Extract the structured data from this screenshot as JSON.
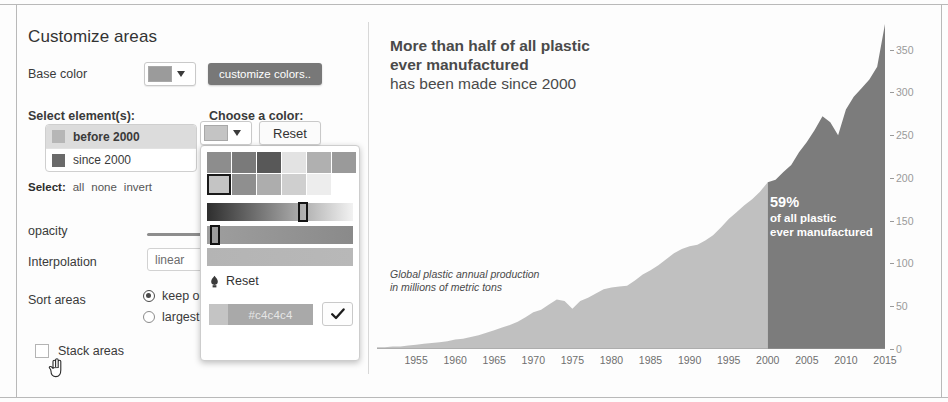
{
  "panel": {
    "title": "Customize areas",
    "base_color_label": "Base color",
    "base_color_value": "#9b9b9b",
    "customize_colors_button": "customize colors..",
    "select_elements_label": "Select element(s):",
    "choose_color_label": "Choose a color:",
    "elements": [
      {
        "label": "before 2000",
        "swatch": "#b6b6b6",
        "selected": true
      },
      {
        "label": "since 2000",
        "swatch": "#6a6a6a",
        "selected": false
      }
    ],
    "select_actions_lead": "Select:",
    "select_actions": [
      "all",
      "none",
      "invert"
    ],
    "opacity_label": "opacity",
    "opacity_value": 100,
    "interpolation_label": "Interpolation",
    "interpolation_value": "linear",
    "sort_label": "Sort areas",
    "sort_options": [
      {
        "label": "keep order",
        "checked": true
      },
      {
        "label": "largest first",
        "checked": false
      }
    ],
    "stack_areas_label": "Stack areas",
    "stack_areas_checked": false,
    "cursor_icon": "hand-pointer-cursor"
  },
  "picker": {
    "current_color": "#c4c4c4",
    "caret_icon": "chevron-down-icon",
    "reset_button": "Reset",
    "reset_row_label": "Reset",
    "reset_row_icon": "reset-brush-icon",
    "hex_value": "#c4c4c4",
    "confirm_icon": "check-icon",
    "swatch_grid": [
      [
        "#8d8d8d",
        "#7a7a7a",
        "#585858",
        "#e3e3e3",
        "#b0b0b0",
        "#9a9a9a"
      ],
      [
        "#c4c4c4",
        "#8f8f8f",
        "#adadad",
        "#cfcfcf",
        "#ededed",
        "#ffffff"
      ]
    ],
    "selected_swatch": {
      "row": 1,
      "col": 0
    },
    "gradients": [
      {
        "from": "#2e2e2e",
        "to": "#f2f2f2",
        "marker_pct": 62
      },
      {
        "from": "#9e9e9e",
        "to": "#8a8a8a",
        "marker_pct": 2
      },
      {
        "from": "#b4b4b4",
        "to": "#b8b8b8",
        "marker_pct": -1
      }
    ]
  },
  "chart_data": {
    "type": "area",
    "title_strong_lines": [
      "More than half of all plastic",
      "ever manufactured"
    ],
    "title_light_line": "has been made since 2000",
    "subtitle_lines": [
      "Global plastic annual production",
      "in millions of metric tons"
    ],
    "xlabel": "",
    "ylabel": "millions of metric tons",
    "xlim": [
      1950,
      2015
    ],
    "ylim": [
      0,
      380
    ],
    "x_ticks": [
      1955,
      1960,
      1965,
      1970,
      1975,
      1980,
      1985,
      1990,
      1995,
      2000,
      2005,
      2010,
      2015
    ],
    "y_ticks": [
      0,
      50,
      100,
      150,
      200,
      250,
      300,
      350
    ],
    "grid": false,
    "legend": "none",
    "split_year": 2000,
    "colors": {
      "before_2000": "#c0c0c0",
      "since_2000": "#7c7c7c"
    },
    "annotation": {
      "percent": "59%",
      "line1": "of all plastic",
      "line2": "ever manufactured"
    },
    "x": [
      1950,
      1951,
      1952,
      1953,
      1954,
      1955,
      1956,
      1957,
      1958,
      1959,
      1960,
      1961,
      1962,
      1963,
      1964,
      1965,
      1966,
      1967,
      1968,
      1969,
      1970,
      1971,
      1972,
      1973,
      1974,
      1975,
      1976,
      1977,
      1978,
      1979,
      1980,
      1981,
      1982,
      1983,
      1984,
      1985,
      1986,
      1987,
      1988,
      1989,
      1990,
      1991,
      1992,
      1993,
      1994,
      1995,
      1996,
      1997,
      1998,
      1999,
      2000,
      2001,
      2002,
      2003,
      2004,
      2005,
      2006,
      2007,
      2008,
      2009,
      2010,
      2011,
      2012,
      2013,
      2014,
      2015
    ],
    "values": [
      2,
      2,
      3,
      3,
      4,
      5,
      6,
      7,
      8,
      9,
      11,
      12,
      14,
      16,
      19,
      22,
      25,
      28,
      32,
      37,
      43,
      46,
      52,
      58,
      56,
      47,
      56,
      60,
      65,
      70,
      72,
      73,
      74,
      80,
      87,
      92,
      98,
      105,
      112,
      117,
      120,
      122,
      127,
      133,
      142,
      152,
      160,
      168,
      175,
      184,
      195,
      198,
      207,
      215,
      230,
      242,
      256,
      272,
      265,
      250,
      280,
      295,
      305,
      315,
      330,
      380
    ]
  }
}
